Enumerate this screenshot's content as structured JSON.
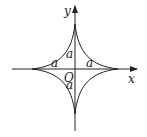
{
  "diagram": {
    "type": "astroid",
    "equation_hint": "x^(2/3) + y^(2/3) = a^(2/3)",
    "axes": {
      "x_label": "x",
      "y_label": "y",
      "origin_label": "O"
    },
    "segment_labels": {
      "top": "a",
      "bottom": "a",
      "left": "a",
      "right": "a"
    },
    "colors": {
      "stroke": "#222222",
      "background": "#ffffff"
    }
  }
}
